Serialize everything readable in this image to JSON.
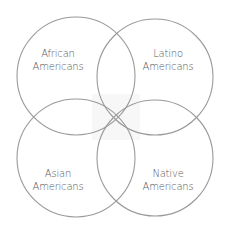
{
  "diagram": {
    "type": "venn",
    "sets": [
      {
        "id": "african",
        "line1": "African",
        "line2": "Americans",
        "cx": 76,
        "cy": 76,
        "r": 59
      },
      {
        "id": "latino",
        "line1": "Latino",
        "line2": "Americans",
        "cx": 155,
        "cy": 77,
        "r": 58
      },
      {
        "id": "asian",
        "line1": "Asian",
        "line2": "Americans",
        "cx": 76,
        "cy": 158,
        "r": 59
      },
      {
        "id": "native",
        "line1": "Native",
        "line2": "Americans",
        "cx": 155,
        "cy": 158,
        "r": 58
      }
    ],
    "colors": {
      "stroke": "#9a9a9a",
      "text": "#5a5a5a",
      "background": "#ffffff",
      "center_fill": "#f7f7f7"
    }
  }
}
